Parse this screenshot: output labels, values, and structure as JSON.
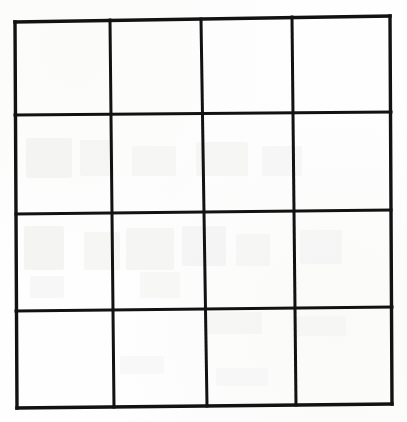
{
  "document": {
    "type": "scanned-paper",
    "description": "Hand-drawn empty 4 by 4 grid on white paper",
    "width": 407,
    "height": 422,
    "background_color": "#fefefe",
    "ink_color": "#121212"
  },
  "grid": {
    "rows": 4,
    "columns": 4,
    "cell_count": 16,
    "all_cells_empty": true,
    "line_color": "#121212",
    "border_stroke_width": 3.4,
    "inner_stroke_width": 3.0,
    "corners": {
      "top_left": {
        "x": 15,
        "y": 22
      },
      "top_right": {
        "x": 390,
        "y": 16
      },
      "bottom_left": {
        "x": 17,
        "y": 408
      },
      "bottom_right": {
        "x": 392,
        "y": 404
      }
    },
    "vertical_dividers": [
      {
        "top_x": 110,
        "bottom_x": 114
      },
      {
        "top_x": 201,
        "bottom_x": 207
      },
      {
        "top_x": 292,
        "bottom_x": 296
      }
    ],
    "horizontal_dividers": [
      {
        "left_y": 115,
        "right_y": 112
      },
      {
        "left_y": 214,
        "right_y": 210
      },
      {
        "left_y": 311,
        "right_y": 307
      }
    ],
    "cells": [
      {
        "row": 1,
        "column": 1,
        "content": ""
      },
      {
        "row": 1,
        "column": 2,
        "content": ""
      },
      {
        "row": 1,
        "column": 3,
        "content": ""
      },
      {
        "row": 1,
        "column": 4,
        "content": ""
      },
      {
        "row": 2,
        "column": 1,
        "content": ""
      },
      {
        "row": 2,
        "column": 2,
        "content": ""
      },
      {
        "row": 2,
        "column": 3,
        "content": ""
      },
      {
        "row": 2,
        "column": 4,
        "content": ""
      },
      {
        "row": 3,
        "column": 1,
        "content": ""
      },
      {
        "row": 3,
        "column": 2,
        "content": ""
      },
      {
        "row": 3,
        "column": 3,
        "content": ""
      },
      {
        "row": 3,
        "column": 4,
        "content": ""
      },
      {
        "row": 4,
        "column": 1,
        "content": ""
      },
      {
        "row": 4,
        "column": 2,
        "content": ""
      },
      {
        "row": 4,
        "column": 3,
        "content": ""
      },
      {
        "row": 4,
        "column": 4,
        "content": ""
      }
    ]
  },
  "artifacts": {
    "note": "Faint grey shapes are show-through from the reverse side of the sheet; not drawn content.",
    "color": "#f2f2f1",
    "blobs": [
      {
        "x": 26,
        "y": 138,
        "width": 46,
        "height": 40,
        "opacity": 0.85
      },
      {
        "x": 80,
        "y": 140,
        "width": 34,
        "height": 36,
        "opacity": 0.7
      },
      {
        "x": 132,
        "y": 146,
        "width": 44,
        "height": 30,
        "opacity": 0.65
      },
      {
        "x": 196,
        "y": 142,
        "width": 52,
        "height": 34,
        "opacity": 0.7
      },
      {
        "x": 262,
        "y": 146,
        "width": 40,
        "height": 30,
        "opacity": 0.6
      },
      {
        "x": 24,
        "y": 226,
        "width": 40,
        "height": 44,
        "opacity": 0.85
      },
      {
        "x": 84,
        "y": 232,
        "width": 36,
        "height": 38,
        "opacity": 0.7
      },
      {
        "x": 126,
        "y": 228,
        "width": 48,
        "height": 42,
        "opacity": 0.8
      },
      {
        "x": 182,
        "y": 226,
        "width": 44,
        "height": 40,
        "opacity": 0.75
      },
      {
        "x": 236,
        "y": 234,
        "width": 34,
        "height": 32,
        "opacity": 0.6
      },
      {
        "x": 300,
        "y": 230,
        "width": 42,
        "height": 34,
        "opacity": 0.6
      },
      {
        "x": 30,
        "y": 276,
        "width": 34,
        "height": 22,
        "opacity": 0.6
      },
      {
        "x": 140,
        "y": 272,
        "width": 40,
        "height": 26,
        "opacity": 0.55
      },
      {
        "x": 204,
        "y": 312,
        "width": 58,
        "height": 22,
        "opacity": 0.6
      },
      {
        "x": 296,
        "y": 316,
        "width": 50,
        "height": 20,
        "opacity": 0.5
      },
      {
        "x": 120,
        "y": 356,
        "width": 44,
        "height": 18,
        "opacity": 0.45
      },
      {
        "x": 216,
        "y": 368,
        "width": 52,
        "height": 18,
        "opacity": 0.45
      }
    ]
  }
}
